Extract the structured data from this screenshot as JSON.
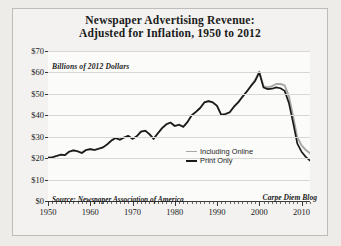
{
  "chart_data": {
    "type": "line",
    "title": "Newspaper Advertising Revenue: Adjusted for Inflation, 1950 to 2012",
    "title_line1": "Newspaper Advertising Revenue:",
    "title_line2": "Adjusted for Inflation, 1950 to 2012",
    "ylabel": "Billions of 2012 Dollars",
    "xlabel": "",
    "ylim": [
      0,
      70
    ],
    "xlim": [
      1950,
      2012
    ],
    "ytick_labels": [
      "$0",
      "$10",
      "$20",
      "$30",
      "$40",
      "$50",
      "$60",
      "$70"
    ],
    "ytick_values": [
      0,
      10,
      20,
      30,
      40,
      50,
      60,
      70
    ],
    "xtick_labels": [
      "1950",
      "1960",
      "1970",
      "1980",
      "1990",
      "2000",
      "2010"
    ],
    "xtick_values": [
      1950,
      1960,
      1970,
      1980,
      1990,
      2000,
      2010
    ],
    "grid": true,
    "legend_position": "center-right",
    "source_note": "Source: Newspaper Association of America",
    "credit_note": "Carpe Diem Blog",
    "colors": {
      "print_only": "#1a1a1a",
      "including_online": "#a7a7a7",
      "gridline": "#d8d7d3",
      "axis": "#3a3a3a",
      "plot_background": "#fbfbfa",
      "page_background": "#edece9"
    },
    "x": [
      1950,
      1951,
      1952,
      1953,
      1954,
      1955,
      1956,
      1957,
      1958,
      1959,
      1960,
      1961,
      1962,
      1963,
      1964,
      1965,
      1966,
      1967,
      1968,
      1969,
      1970,
      1971,
      1972,
      1973,
      1974,
      1975,
      1976,
      1977,
      1978,
      1979,
      1980,
      1981,
      1982,
      1983,
      1984,
      1985,
      1986,
      1987,
      1988,
      1989,
      1990,
      1991,
      1992,
      1993,
      1994,
      1995,
      1996,
      1997,
      1998,
      1999,
      2000,
      2001,
      2002,
      2003,
      2004,
      2005,
      2006,
      2007,
      2008,
      2009,
      2010,
      2011,
      2012
    ],
    "series": [
      {
        "name": "Print Only",
        "color": "#1a1a1a",
        "values": [
          20.2,
          20.4,
          21.0,
          21.6,
          21.4,
          23.0,
          23.6,
          23.2,
          22.4,
          23.8,
          24.2,
          23.8,
          24.4,
          25.0,
          26.4,
          28.2,
          29.4,
          28.6,
          29.6,
          30.4,
          29.0,
          30.2,
          32.4,
          32.8,
          31.2,
          29.0,
          31.6,
          34.0,
          35.8,
          36.6,
          35.0,
          35.6,
          34.6,
          36.8,
          40.0,
          41.6,
          43.4,
          46.0,
          46.6,
          46.0,
          44.4,
          40.2,
          40.6,
          41.4,
          44.0,
          46.0,
          48.6,
          51.0,
          53.6,
          56.0,
          60.0,
          53.0,
          52.2,
          52.4,
          53.0,
          52.6,
          51.4,
          45.8,
          36.6,
          26.8,
          23.0,
          20.6,
          18.8
        ]
      },
      {
        "name": "Including Online",
        "color": "#a7a7a7",
        "values": [
          20.2,
          20.4,
          21.0,
          21.6,
          21.4,
          23.0,
          23.6,
          23.2,
          22.4,
          23.8,
          24.2,
          23.8,
          24.4,
          25.0,
          26.4,
          28.2,
          29.4,
          28.6,
          29.6,
          30.4,
          29.0,
          30.2,
          32.4,
          32.8,
          31.2,
          29.0,
          31.6,
          34.0,
          35.8,
          36.6,
          35.0,
          35.6,
          34.6,
          36.8,
          40.0,
          41.6,
          43.4,
          46.0,
          46.6,
          46.0,
          44.4,
          40.2,
          40.6,
          41.4,
          44.0,
          46.0,
          48.6,
          51.0,
          53.8,
          56.4,
          60.4,
          53.6,
          53.0,
          53.6,
          54.6,
          54.6,
          54.0,
          48.9,
          39.6,
          29.6,
          26.0,
          23.8,
          22.3
        ]
      }
    ],
    "annotations": [
      {
        "text": "Source: Newspaper Association of America",
        "position": "bottom-left"
      },
      {
        "text": "Carpe Diem Blog",
        "position": "bottom-right"
      }
    ]
  },
  "legend": {
    "items": [
      {
        "label": "Including Online",
        "key": "including-online"
      },
      {
        "label": "Print Only",
        "key": "print-only"
      }
    ]
  }
}
